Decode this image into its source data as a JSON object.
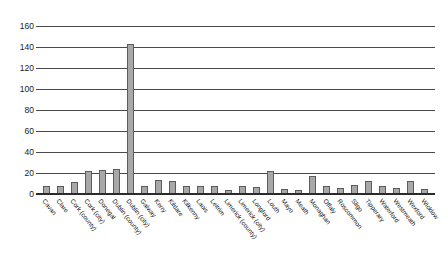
{
  "chart_data": {
    "type": "bar",
    "title": "",
    "xlabel": "",
    "ylabel": "",
    "ylim": [
      0,
      160
    ],
    "ytick_step": 20,
    "yticks": [
      160,
      140,
      120,
      100,
      80,
      60,
      40,
      20,
      0
    ],
    "grid": true,
    "legend": false,
    "bar_color": "#a8a8a8",
    "bar_edge_color": "#5c5c5c",
    "categories": [
      "Cavan",
      "Clare",
      "Cork (county)",
      "Cork (city)",
      "Donegal",
      "Dublin (county)",
      "Dublin (city)",
      "Galway",
      "Kerry",
      "Kildare",
      "Kilkenny",
      "Laois",
      "Leitrim",
      "Limerick (county)",
      "Limerick (city)",
      "Longford",
      "Louth",
      "Mayo",
      "Meath",
      "Monaghan",
      "Offaly",
      "Roscommon",
      "Sligo",
      "Tipperary",
      "Waterford",
      "Westmeath",
      "Wexford",
      "Wicklow"
    ],
    "values": [
      8,
      8,
      11,
      22,
      23,
      24,
      143,
      8,
      13,
      12,
      8,
      8,
      8,
      4,
      8,
      7,
      22,
      5,
      4,
      17,
      8,
      6,
      9,
      12,
      8,
      6,
      12,
      5
    ]
  }
}
